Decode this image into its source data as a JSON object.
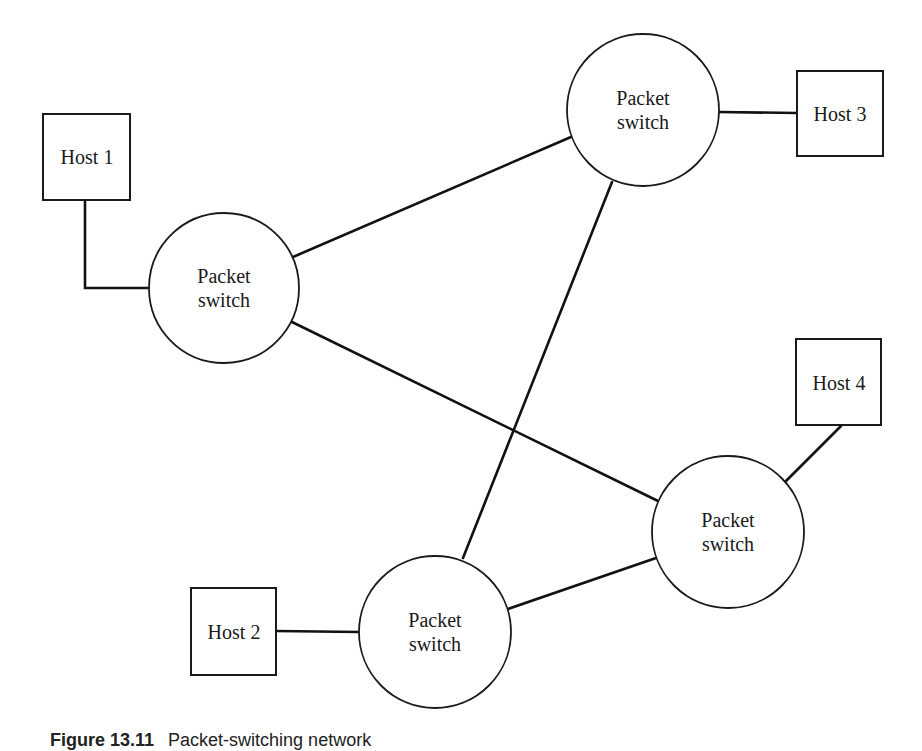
{
  "diagram": {
    "type": "network-topology",
    "colors": {
      "line": "#111111",
      "node_fill": "#ffffff",
      "background": "#ffffff"
    },
    "switches": [
      {
        "id": "switch-left",
        "label_line1": "Packet",
        "label_line2": "switch",
        "cx": 224,
        "cy": 288,
        "r": 75
      },
      {
        "id": "switch-top",
        "label_line1": "Packet",
        "label_line2": "switch",
        "cx": 643,
        "cy": 110,
        "r": 76
      },
      {
        "id": "switch-right",
        "label_line1": "Packet",
        "label_line2": "switch",
        "cx": 728,
        "cy": 532,
        "r": 76
      },
      {
        "id": "switch-bottom",
        "label_line1": "Packet",
        "label_line2": "switch",
        "cx": 435,
        "cy": 632,
        "r": 76
      }
    ],
    "hosts": [
      {
        "id": "host-1",
        "label": "Host 1",
        "x": 43,
        "y": 114,
        "w": 87,
        "h": 86,
        "attached_to": "switch-left"
      },
      {
        "id": "host-2",
        "label": "Host 2",
        "x": 191,
        "y": 588,
        "w": 85,
        "h": 87,
        "attached_to": "switch-bottom"
      },
      {
        "id": "host-3",
        "label": "Host 3",
        "x": 797,
        "y": 71,
        "w": 86,
        "h": 85,
        "attached_to": "switch-top"
      },
      {
        "id": "host-4",
        "label": "Host 4",
        "x": 796,
        "y": 339,
        "w": 85,
        "h": 86,
        "attached_to": "switch-right"
      }
    ],
    "links": [
      {
        "from": "host-1",
        "to": "switch-left"
      },
      {
        "from": "host-2",
        "to": "switch-bottom"
      },
      {
        "from": "host-3",
        "to": "switch-top"
      },
      {
        "from": "host-4",
        "to": "switch-right"
      },
      {
        "from": "switch-left",
        "to": "switch-top"
      },
      {
        "from": "switch-left",
        "to": "switch-right"
      },
      {
        "from": "switch-top",
        "to": "switch-bottom"
      },
      {
        "from": "switch-bottom",
        "to": "switch-right"
      }
    ]
  },
  "caption": {
    "figure_number": "Figure 13.11",
    "text": "Packet-switching network"
  }
}
